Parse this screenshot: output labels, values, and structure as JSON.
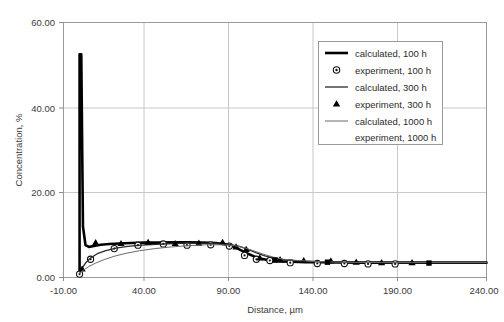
{
  "chart_data": {
    "type": "line",
    "title": "",
    "xlabel": "Distance, µm",
    "ylabel": "Concentration, %",
    "xlim": [
      -10,
      240
    ],
    "ylim": [
      0,
      60
    ],
    "xticks": [
      "-10.00",
      "40.00",
      "90.00",
      "140.00",
      "190.00",
      "240.00"
    ],
    "yticks": [
      "0.00",
      "20.00",
      "40.00",
      "60.00"
    ],
    "xtick_values": [
      -10,
      40,
      90,
      140,
      190,
      240
    ],
    "ytick_values": [
      0,
      20,
      40,
      60
    ],
    "grid": true,
    "legend_position": "upper-right",
    "series": [
      {
        "name": "calculated, 100 h",
        "kind": "line",
        "style": "thick-solid-black",
        "color": "#000000",
        "x": [
          -0.5,
          -0.5,
          0.5,
          1.5,
          3,
          5,
          8,
          12,
          17,
          23,
          30,
          38,
          46,
          55,
          64,
          72,
          80,
          86,
          91,
          95,
          99,
          103,
          107,
          112,
          118,
          125,
          133,
          142,
          152,
          165,
          180,
          200,
          220,
          240
        ],
        "y": [
          0.6,
          52.5,
          52.5,
          12.0,
          7.6,
          7.2,
          7.4,
          7.7,
          7.9,
          8.0,
          8.1,
          8.2,
          8.2,
          8.3,
          8.3,
          8.2,
          8.1,
          7.8,
          7.2,
          6.4,
          5.6,
          4.9,
          4.4,
          4.0,
          3.8,
          3.7,
          3.6,
          3.6,
          3.55,
          3.5,
          3.5,
          3.5,
          3.5,
          3.5
        ]
      },
      {
        "name": "experiment, 100 h",
        "kind": "scatter",
        "marker": "open-circle-dot",
        "color": "#111111",
        "x": [
          -0.5,
          6,
          20,
          34,
          49,
          63,
          77,
          88,
          97,
          104,
          112,
          124,
          140,
          156,
          170,
          186
        ],
        "y": [
          0.8,
          4.3,
          6.8,
          7.6,
          7.9,
          7.6,
          7.7,
          7.4,
          5.2,
          4.3,
          4.0,
          3.5,
          3.3,
          3.3,
          3.2,
          3.2
        ]
      },
      {
        "name": "calculated, 300 h",
        "kind": "line",
        "style": "medium-solid-black",
        "color": "#2a2a2a",
        "x": [
          -0.5,
          1,
          3,
          6,
          10,
          15,
          21,
          28,
          36,
          45,
          55,
          64,
          73,
          81,
          88,
          94,
          99,
          104,
          109,
          115,
          122,
          130,
          140,
          152,
          166,
          182,
          200,
          220,
          240
        ],
        "y": [
          0.9,
          2.2,
          3.4,
          4.6,
          5.6,
          6.3,
          6.9,
          7.3,
          7.6,
          7.8,
          8.0,
          8.1,
          8.1,
          8.0,
          7.8,
          7.3,
          6.6,
          5.8,
          5.1,
          4.5,
          4.1,
          3.9,
          3.7,
          3.6,
          3.55,
          3.5,
          3.5,
          3.5,
          3.5
        ]
      },
      {
        "name": "experiment, 300 h",
        "kind": "scatter",
        "marker": "filled-triangle",
        "color": "#000000",
        "x": [
          1,
          9,
          24,
          40,
          56,
          70,
          84,
          92,
          98,
          106,
          118,
          132,
          148,
          163,
          178,
          196
        ],
        "y": [
          2.0,
          8.2,
          8.0,
          8.3,
          8.0,
          8.1,
          8.3,
          7.2,
          6.6,
          4.6,
          4.2,
          4.0,
          3.9,
          3.6,
          3.5,
          3.5
        ]
      },
      {
        "name": "calculated, 1000 h",
        "kind": "line",
        "style": "thin-solid-gray",
        "color": "#6b6b6b",
        "x": [
          -0.5,
          2,
          5,
          9,
          14,
          20,
          27,
          35,
          44,
          54,
          64,
          74,
          83,
          91,
          97,
          103,
          108,
          114,
          120,
          128,
          138,
          150,
          164,
          180,
          200,
          220,
          240
        ],
        "y": [
          1.0,
          1.8,
          2.6,
          3.4,
          4.2,
          5.0,
          5.7,
          6.3,
          6.8,
          7.2,
          7.5,
          7.7,
          7.7,
          7.5,
          7.0,
          6.2,
          5.5,
          4.8,
          4.3,
          4.0,
          3.8,
          3.65,
          3.55,
          3.5,
          3.5,
          3.5,
          3.5
        ]
      },
      {
        "name": "experiment, 1000 h",
        "kind": "scatter",
        "marker": "filled-square",
        "color": "#000000",
        "x": [
          115,
          146,
          206
        ],
        "y": [
          4.1,
          3.6,
          3.4
        ]
      }
    ],
    "annotations": []
  },
  "legend": {
    "items": [
      {
        "label": "calculated, 100 h",
        "marker": "thick-line"
      },
      {
        "label": "experiment, 100 h",
        "marker": "open-circle-dot"
      },
      {
        "label": "calculated, 300 h",
        "marker": "medium-line"
      },
      {
        "label": "experiment, 300 h",
        "marker": "filled-triangle"
      },
      {
        "label": "calculated, 1000 h",
        "marker": "thin-line"
      },
      {
        "label": "experiment, 1000 h",
        "marker": "none"
      }
    ]
  }
}
